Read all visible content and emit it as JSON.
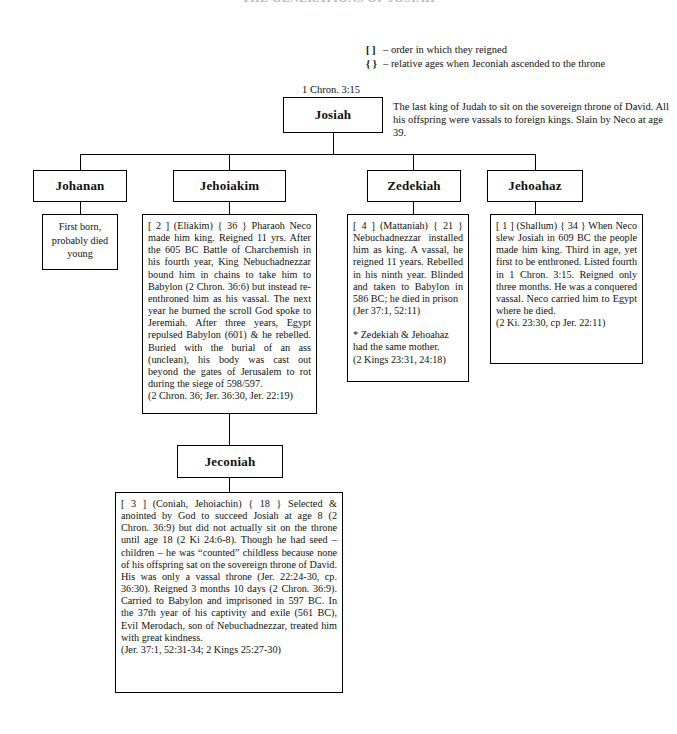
{
  "document": {
    "title": "THE GENERATIONS OF JOSIAH"
  },
  "legend": {
    "rows": [
      {
        "symbol": "[  ]",
        "text": "– order in which they reigned"
      },
      {
        "symbol": "{  }",
        "text": "– relative ages when Jeconiah ascended to the throne"
      }
    ]
  },
  "captions": {
    "josiah_reference": "1 Chron. 3:15"
  },
  "nodes": {
    "josiah": {
      "name": "Josiah",
      "description": "The last king of Judah to sit on the sovereign throne of David. All his offspring were vassals to foreign kings. Slain by Neco at age 39."
    },
    "johanan": {
      "name": "Johanan",
      "note": "First born, probably died young"
    },
    "jehoiakim": {
      "name": "Jehoiakim",
      "note_main": "[ 2 ]  (Eliakim)  { 36 }   Pharaoh Neco made him king. Reigned 11 yrs. After the 605 BC Battle of Charchemish in his fourth year, King Nebuchadnezzar bound him in chains to take him to Babylon  (2 Chron. 36:6) but instead re-enthroned him as his vassal. The next year he burned the scroll God spoke to Jeremiah. After three years, Egypt repulsed Babylon (601) & he rebelled. Buried with the burial of an ass (unclean), his body was cast out beyond the gates of Jerusalem to rot during the siege of 598/597.",
      "note_refs": "(2 Chron. 36; Jer. 36:30, Jer. 22:19)"
    },
    "zedekiah": {
      "name": "Zedekiah",
      "note_main": "[ 4 ]  (Mattaniah)  { 21 } Nebuchadnezzar installed him as king. A vassal, he reigned 11 years. Rebelled in his ninth year. Blinded and taken to Babylon in 586 BC; he died in prison",
      "note_refs": "(Jer 37:1, 52:11)",
      "note_footnote": "* Zedekiah & Jehoahaz had the same mother.",
      "note_footnote_refs": "(2 Kings 23:31, 24:18)"
    },
    "jehoahaz": {
      "name": "Jehoahaz",
      "note_main": "[ 1 ]  (Shallum)  { 34 } When Neco slew Josiah in 609 BC the people made him king. Third in age, yet first to be enthroned. Listed fourth in 1 Chron. 3:15. Reigned only three months. He was a conquered vassal. Neco carried him to Egypt where he died.",
      "note_refs": "(2 Ki. 23:30, cp Jer. 22:11)"
    },
    "jeconiah": {
      "name": "Jeconiah",
      "note_main": "[ 3 ]  (Coniah, Jehoiachin)  { 18 } Selected & anointed by God to succeed Josiah at age 8 (2 Chron. 36:9) but did not actually sit on the throne until age 18 (2 Ki 24:6-8). Though he had seed – children – he was “counted” childless because none of his offspring sat on the sovereign throne of David. His was only a vassal throne (Jer. 22:24-30, cp. 36:30). Reigned 3 months 10 days (2 Chron. 36:9). Carried to Babylon and imprisoned in 597 BC. In the 37th year of his captivity and exile (561 BC), Evil Merodach, son of Nebuchadnezzar, treated him with great kindness.",
      "note_refs": "(Jer. 37:1, 52:31-34; 2 Kings 25:27-30)"
    }
  },
  "colors": {
    "line": "#000000",
    "background": "#ffffff",
    "text": "#111111"
  }
}
